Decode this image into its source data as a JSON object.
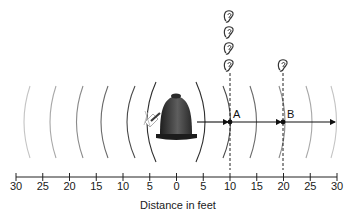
{
  "diagram": {
    "axis": {
      "title": "Distance in feet",
      "ticks": [
        "30",
        "25",
        "20",
        "15",
        "10",
        "5",
        "0",
        "5",
        "10",
        "15",
        "20",
        "25",
        "30"
      ]
    },
    "points": [
      {
        "label": "A",
        "distance_ft": 10,
        "listeners": 4
      },
      {
        "label": "B",
        "distance_ft": 20,
        "listeners": 1
      }
    ],
    "source": {
      "name": "bell",
      "icon": "bell-icon"
    },
    "colors": {
      "ink": "#1a1a1a",
      "bell_dark": "#2a2a2a",
      "bell_light": "#6a6a6a",
      "wave_near": "#333333",
      "wave_far": "#c8c8c8"
    }
  }
}
